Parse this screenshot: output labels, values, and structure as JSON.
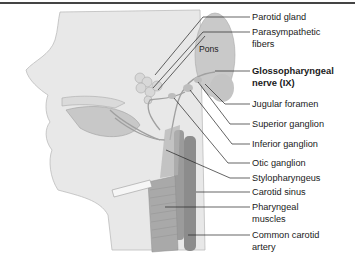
{
  "figure": {
    "structure_label": "Pons",
    "labels": [
      {
        "id": "parotid-gland",
        "lines": [
          "Parotid gland"
        ],
        "bold": false,
        "top": 11,
        "leader_y": 17
      },
      {
        "id": "parasympathetic-fibers",
        "lines": [
          "Parasympathetic",
          "fibers"
        ],
        "bold": false,
        "top": 26,
        "leader_y": 32
      },
      {
        "id": "glossopharyngeal-nerve",
        "lines": [
          "Glossopharyngeal",
          "nerve (IX)"
        ],
        "bold": true,
        "top": 65,
        "leader_y": 71
      },
      {
        "id": "jugular-foramen",
        "lines": [
          "Jugular foramen"
        ],
        "bold": false,
        "top": 98,
        "leader_y": 104
      },
      {
        "id": "superior-ganglion",
        "lines": [
          "Superior ganglion"
        ],
        "bold": false,
        "top": 118,
        "leader_y": 124
      },
      {
        "id": "inferior-ganglion",
        "lines": [
          "Inferior ganglion"
        ],
        "bold": false,
        "top": 138,
        "leader_y": 144
      },
      {
        "id": "otic-ganglion",
        "lines": [
          "Otic ganglion"
        ],
        "bold": false,
        "top": 157,
        "leader_y": 163
      },
      {
        "id": "stylopharyngeus",
        "lines": [
          "Stylopharyngeus"
        ],
        "bold": false,
        "top": 172,
        "leader_y": 178
      },
      {
        "id": "carotid-sinus",
        "lines": [
          "Carotid sinus"
        ],
        "bold": false,
        "top": 186,
        "leader_y": 192
      },
      {
        "id": "pharyngeal-muscles",
        "lines": [
          "Pharyngeal",
          "muscles"
        ],
        "bold": false,
        "top": 201,
        "leader_y": 207
      },
      {
        "id": "common-carotid-artery",
        "lines": [
          "Common carotid",
          "artery"
        ],
        "bold": false,
        "top": 229,
        "leader_y": 235
      }
    ]
  }
}
